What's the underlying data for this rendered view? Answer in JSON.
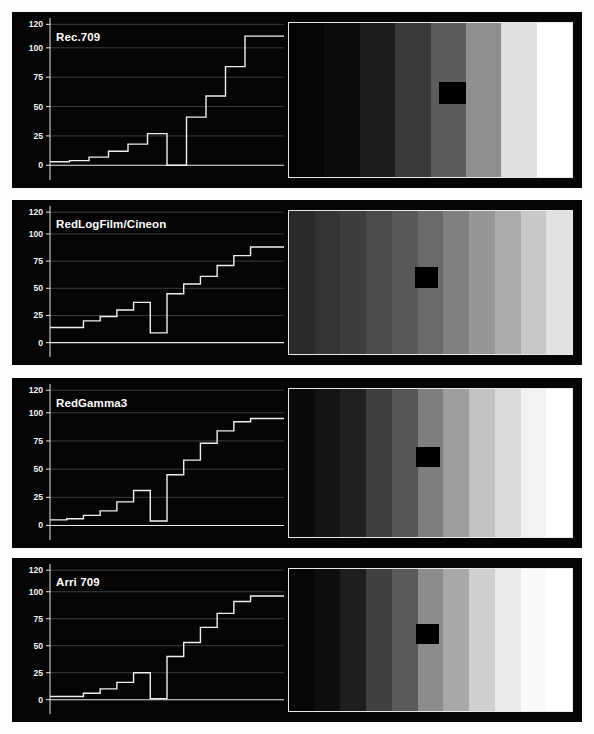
{
  "figure": {
    "background": "#fdfdfd",
    "panel_background": "#050505",
    "trace_color": "#f0f0f0",
    "grid_color": "#4a4a4a",
    "axis_color": "#e8e8e8",
    "patch_color": "#000000"
  },
  "axis": {
    "y_ticks": [
      "120",
      "100",
      "75",
      "50",
      "25",
      "0"
    ],
    "y_values": [
      120,
      100,
      75,
      50,
      25,
      0
    ],
    "ylim": [
      -4,
      122
    ],
    "xlim": [
      0,
      11
    ],
    "grid": true
  },
  "panels": [
    {
      "id": "rec709",
      "label": "Rec.709",
      "chart": {
        "type": "line",
        "title": "Rec.709",
        "xlabel": "",
        "ylabel": "IRE",
        "step_values": [
          3,
          4,
          7,
          12,
          18,
          27,
          0,
          41,
          59,
          84,
          110,
          110
        ],
        "notch_index": 6,
        "notch_floor": 0,
        "notch_top": 41
      },
      "ramp": {
        "colors": [
          "#050505",
          "#0c0c0c",
          "#1c1c1c",
          "#3a3a3a",
          "#5c5c5c",
          "#8e8e8e",
          "#e0e0e0",
          "#ffffff"
        ],
        "patch": {
          "left_pct": 53.0,
          "top_pct": 38.0,
          "width_pct": 9.5,
          "height_pct": 14.5
        }
      }
    },
    {
      "id": "redlogfilm",
      "label": "RedLogFilm/Cineon",
      "chart": {
        "type": "line",
        "title": "RedLogFilm/Cineon",
        "xlabel": "",
        "ylabel": "IRE",
        "step_values": [
          14,
          14,
          20,
          24,
          30,
          37,
          9,
          45,
          54,
          61,
          71,
          80,
          88,
          88
        ],
        "notch_index": 6,
        "notch_floor": 9,
        "notch_top": 45
      },
      "ramp": {
        "colors": [
          "#2a2a2a",
          "#343434",
          "#3d3d3d",
          "#4a4a4a",
          "#585858",
          "#6a6a6a",
          "#808080",
          "#969696",
          "#ababab",
          "#c8c8c8",
          "#e2e2e2"
        ],
        "patch": {
          "left_pct": 44.5,
          "top_pct": 39.5,
          "width_pct": 8.0,
          "height_pct": 14.0
        }
      }
    },
    {
      "id": "redgamma3",
      "label": "RedGamma3",
      "chart": {
        "type": "line",
        "title": "RedGamma3",
        "xlabel": "",
        "ylabel": "IRE",
        "step_values": [
          5,
          6,
          9,
          13,
          21,
          31,
          4,
          45,
          58,
          73,
          84,
          92,
          95,
          95
        ],
        "notch_index": 6,
        "notch_floor": 4,
        "notch_top": 45
      },
      "ramp": {
        "colors": [
          "#0a0a0a",
          "#141414",
          "#212121",
          "#3e3e3e",
          "#565656",
          "#7e7e7e",
          "#9e9e9e",
          "#c2c2c2",
          "#dcdcdc",
          "#f2f2f2",
          "#ffffff"
        ],
        "patch": {
          "left_pct": 45.0,
          "top_pct": 39.0,
          "width_pct": 8.5,
          "height_pct": 14.0
        }
      }
    },
    {
      "id": "arri709",
      "label": "Arri 709",
      "chart": {
        "type": "line",
        "title": "Arri 709",
        "xlabel": "",
        "ylabel": "IRE",
        "step_values": [
          3,
          3,
          6,
          10,
          16,
          25,
          1,
          40,
          53,
          67,
          80,
          91,
          96,
          96
        ],
        "notch_index": 6,
        "notch_floor": 1,
        "notch_top": 40
      },
      "ramp": {
        "colors": [
          "#060606",
          "#0e0e0e",
          "#1e1e1e",
          "#404040",
          "#5a5a5a",
          "#8c8c8c",
          "#a8a8a8",
          "#cfcfcf",
          "#ebebeb",
          "#fafafa",
          "#ffffff"
        ],
        "patch": {
          "left_pct": 45.0,
          "top_pct": 39.0,
          "width_pct": 8.0,
          "height_pct": 14.0
        }
      }
    }
  ],
  "layout": {
    "panel_tops": [
      12,
      200,
      378,
      558
    ],
    "panel_heights": [
      176,
      165,
      170,
      164
    ]
  }
}
